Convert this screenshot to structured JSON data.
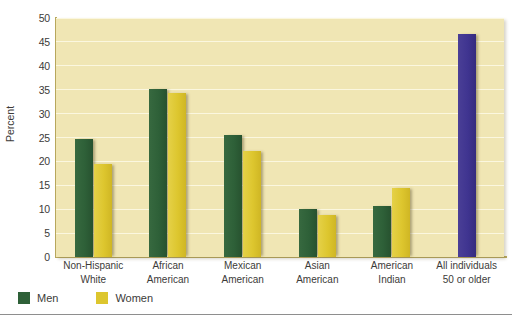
{
  "chart_data": {
    "type": "bar",
    "title": "",
    "subtitle": "",
    "xlabel": "",
    "ylabel": "Percent",
    "ylim": [
      0,
      50
    ],
    "ytick_step": 5,
    "yticks": [
      "50",
      "45",
      "40",
      "35",
      "30",
      "25",
      "20",
      "15",
      "10",
      "5",
      "0"
    ],
    "grid": true,
    "legend_position": "bottom-left",
    "categories": [
      "Non-Hispanic White",
      "African American",
      "Mexican American",
      "Asian American",
      "American Indian",
      "All individuals 50 or older"
    ],
    "category_lines": [
      [
        "Non-Hispanic",
        "White"
      ],
      [
        "African",
        "American"
      ],
      [
        "Mexican",
        "American"
      ],
      [
        "Asian",
        "American"
      ],
      [
        "American",
        "Indian"
      ],
      [
        "All individuals",
        "50 or older"
      ]
    ],
    "series": [
      {
        "name": "Men",
        "color": "#2e6038",
        "values": [
          24.7,
          35.2,
          25.5,
          10.1,
          10.7,
          null
        ]
      },
      {
        "name": "Women",
        "color": "#ddc62e",
        "values": [
          19.5,
          34.4,
          22.2,
          8.7,
          14.5,
          null
        ]
      },
      {
        "name": "All individuals 50 or older",
        "color": "#3f3490",
        "values": [
          null,
          null,
          null,
          null,
          null,
          46.6
        ]
      }
    ]
  },
  "legend": {
    "items": [
      {
        "label": "Men",
        "color": "#2e6038"
      },
      {
        "label": "Women",
        "color": "#ddc62e"
      }
    ]
  },
  "axis": {
    "y_title": "Percent"
  },
  "colors": {
    "plot_background": "#f0e6b4",
    "gridline": "#fbf7df",
    "axis": "#b9a95e",
    "men": "#2e6038",
    "women": "#ddc62e",
    "all_individuals": "#3f3490",
    "text": "#3c3b39"
  }
}
